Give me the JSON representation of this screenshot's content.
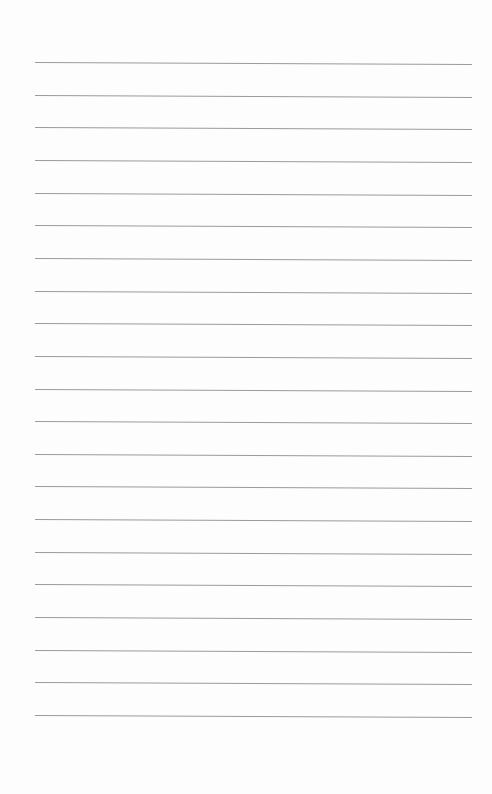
{
  "page": {
    "type": "blank lined paper",
    "background_color": "#fdfdfd",
    "rule_color": "#9a9a9a",
    "rule_count": 21,
    "first_rule_y": 62,
    "rule_spacing": 32.65,
    "rule_left": 35,
    "rule_right": 472
  }
}
